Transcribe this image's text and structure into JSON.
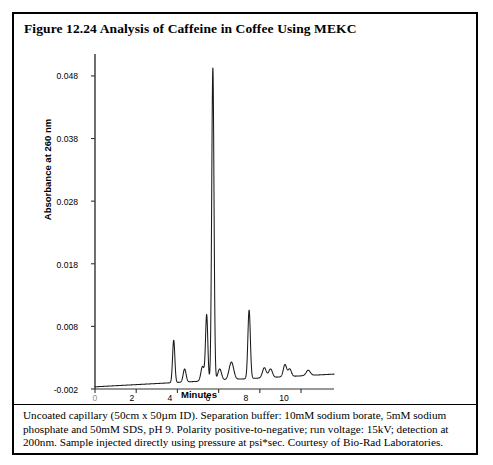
{
  "figure": {
    "title": "Figure 12.24  Analysis of Caffeine in Coffee Using MEKC",
    "caption": "Uncoated capillary (50cm x 50µm ID). Separation buffer: 10mM sodium borate, 5mM sodium phosphate and 50mM SDS, pH 9. Polarity positive-to-negative; run voltage: 15kV; detection at 200nm. Sample injected directly using pressure at psi*sec.  Courtesy of Bio-Rad Laboratories.",
    "border_color": "#000000",
    "background_color": "#ffffff",
    "trace_color": "#1a1a1a"
  },
  "chart_data": {
    "type": "line",
    "title": "Analysis of Caffeine in Coffee Using MEKC",
    "xlabel": "Minutes",
    "ylabel": "Absorbance at 260 nm",
    "xlim": [
      0,
      11.6
    ],
    "ylim": [
      -0.002,
      0.0515
    ],
    "grid": false,
    "legend": "none",
    "xticks": [
      0,
      2,
      4,
      6,
      8,
      10
    ],
    "xtick_labels": [
      "0",
      "2",
      "4",
      "6",
      "8",
      "10"
    ],
    "yticks": [
      -0.002,
      0.008,
      0.018,
      0.028,
      0.038,
      0.048
    ],
    "ytick_labels": [
      "-0.002",
      "0.008",
      "0.018",
      "0.028",
      "0.038",
      "0.048"
    ],
    "baseline": -0.0008,
    "peaks": [
      {
        "label": "peak-1",
        "center": 3.82,
        "height": 0.0058,
        "width": 0.055
      },
      {
        "label": "peak-2",
        "center": 4.35,
        "height": 0.0012,
        "width": 0.07
      },
      {
        "label": "peak-3",
        "center": 5.22,
        "height": 0.0016,
        "width": 0.08
      },
      {
        "label": "peak-4",
        "center": 5.42,
        "height": 0.0098,
        "width": 0.055
      },
      {
        "label": "peak-5-caffeine",
        "center": 5.72,
        "height": 0.0493,
        "width": 0.055
      },
      {
        "label": "peak-6",
        "center": 6.05,
        "height": 0.0012,
        "width": 0.09
      },
      {
        "label": "peak-7",
        "center": 6.62,
        "height": 0.0023,
        "width": 0.11
      },
      {
        "label": "peak-8",
        "center": 7.48,
        "height": 0.0106,
        "width": 0.06
      },
      {
        "label": "peak-9",
        "center": 8.22,
        "height": 0.0014,
        "width": 0.09
      },
      {
        "label": "peak-10",
        "center": 8.52,
        "height": 0.0012,
        "width": 0.09
      },
      {
        "label": "peak-11",
        "center": 9.22,
        "height": 0.0019,
        "width": 0.08
      },
      {
        "label": "peak-12",
        "center": 9.45,
        "height": 0.0012,
        "width": 0.08
      },
      {
        "label": "peak-13",
        "center": 10.35,
        "height": 0.001,
        "width": 0.1
      }
    ],
    "x": [
      0.0,
      0.2,
      0.4,
      0.6,
      0.8,
      1.0,
      1.2,
      1.4,
      1.6,
      1.8,
      2.0,
      2.2,
      2.4,
      2.6,
      2.8,
      3.0,
      3.2,
      3.4,
      3.6,
      3.82,
      4.0,
      4.35,
      4.6,
      5.0,
      5.22,
      5.42,
      5.72,
      6.05,
      6.4,
      6.62,
      7.0,
      7.48,
      7.9,
      8.22,
      8.52,
      8.9,
      9.22,
      9.45,
      9.9,
      10.35,
      10.8,
      11.3
    ],
    "y": [
      -0.0016,
      -0.0015,
      -0.0014,
      -0.0014,
      -0.0013,
      -0.0013,
      -0.0012,
      -0.0012,
      -0.0011,
      -0.0011,
      -0.001,
      -0.001,
      -0.0009,
      -0.0009,
      -0.0008,
      -0.0008,
      -0.0007,
      -0.0007,
      -0.0006,
      0.0058,
      -0.0005,
      0.0012,
      -0.0004,
      -0.0003,
      0.0016,
      0.0098,
      0.0493,
      0.0012,
      -0.0001,
      0.0023,
      0.0,
      0.0106,
      0.0001,
      0.0014,
      0.0012,
      0.0002,
      0.0019,
      0.0012,
      0.0003,
      0.001,
      0.0003,
      0.0003
    ]
  }
}
